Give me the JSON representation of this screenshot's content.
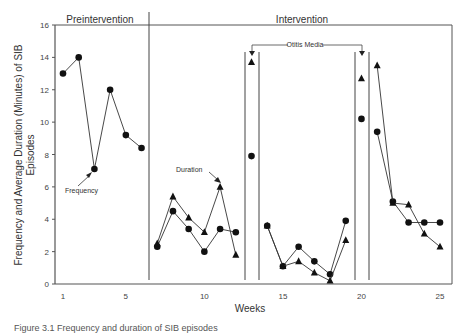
{
  "chart_data": {
    "type": "line",
    "title": "",
    "xlabel": "Weeks",
    "ylabel": "Frequency and Average Duration (Minutes) of SIB Episodes",
    "ylim": [
      0,
      16
    ],
    "xlim": [
      1,
      25
    ],
    "yticks": [
      0,
      2,
      4,
      6,
      8,
      10,
      12,
      14,
      16
    ],
    "xticks": [
      1,
      5,
      10,
      15,
      20,
      25
    ],
    "grid": false,
    "legend": "none (inline annotations)",
    "phases": [
      {
        "label": "Preintervention",
        "weeks": [
          1,
          6
        ]
      },
      {
        "label": "Intervention",
        "weeks": [
          7,
          25
        ]
      }
    ],
    "annotations": [
      {
        "text": "Frequency",
        "points_to_week": 3
      },
      {
        "text": "Duration",
        "points_to_week": 11
      },
      {
        "text": "Otitis Media",
        "weeks": [
          13,
          20
        ]
      }
    ],
    "series": [
      {
        "name": "Frequency",
        "marker": "circle",
        "segments": [
          {
            "x": [
              1,
              2,
              3,
              4,
              5,
              6
            ],
            "y": [
              13.0,
              14.0,
              7.1,
              12.0,
              9.2,
              8.4
            ]
          },
          {
            "x": [
              7,
              8,
              9,
              10,
              11,
              12
            ],
            "y": [
              2.3,
              4.5,
              3.4,
              2.0,
              3.4,
              3.2
            ]
          },
          {
            "x": [
              13
            ],
            "y": [
              7.9
            ]
          },
          {
            "x": [
              14,
              15,
              16,
              17,
              18,
              19
            ],
            "y": [
              3.6,
              1.1,
              2.3,
              1.4,
              0.6,
              3.9
            ]
          },
          {
            "x": [
              20
            ],
            "y": [
              10.2
            ]
          },
          {
            "x": [
              21,
              22,
              23,
              24,
              25
            ],
            "y": [
              9.4,
              5.1,
              3.8,
              3.8,
              3.8
            ]
          }
        ]
      },
      {
        "name": "Duration",
        "marker": "triangle",
        "segments": [
          {
            "x": [
              7,
              8,
              9,
              10,
              11,
              12
            ],
            "y": [
              2.5,
              5.4,
              4.1,
              3.2,
              6.0,
              1.8
            ]
          },
          {
            "x": [
              13
            ],
            "y": [
              13.7
            ]
          },
          {
            "x": [
              14,
              15,
              16,
              17,
              18,
              19
            ],
            "y": [
              3.6,
              1.1,
              1.4,
              0.7,
              0.2,
              2.7
            ]
          },
          {
            "x": [
              20
            ],
            "y": [
              12.7
            ]
          },
          {
            "x": [
              21,
              22,
              23,
              24,
              25
            ],
            "y": [
              13.5,
              5.0,
              4.9,
              3.1,
              2.3
            ]
          }
        ]
      }
    ],
    "phase_lines_weeks": [
      6.5,
      12.6,
      13.5,
      19.6,
      20.5
    ]
  },
  "labels": {
    "preintervention": "Preintervention",
    "intervention": "Intervention",
    "otitis_media": "Otitis Media",
    "frequency": "Frequency",
    "duration": "Duration",
    "xlabel": "Weeks",
    "ylabel_line1": "Frequency and Average Duration (Minutes) of SIB",
    "ylabel_line2": "Episodes"
  },
  "caption": "Figure 3.1 Frequency and duration of SIB episodes"
}
